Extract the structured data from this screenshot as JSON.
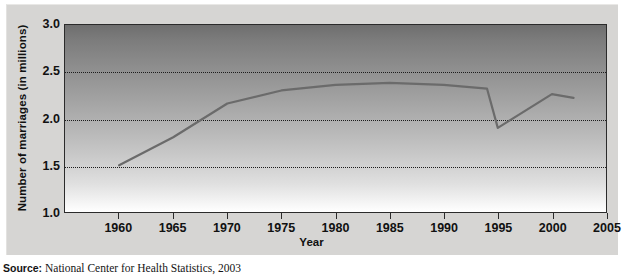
{
  "chart_data": {
    "type": "line",
    "title": "",
    "xlabel": "Year",
    "ylabel": "Number of marriages (in millions)",
    "xlim": [
      1955,
      2005
    ],
    "ylim": [
      1.0,
      3.0
    ],
    "xticks": [
      1960,
      1965,
      1970,
      1975,
      1980,
      1985,
      1990,
      1995,
      2000,
      2005
    ],
    "yticks": [
      1.0,
      1.5,
      2.0,
      2.5,
      3.0
    ],
    "xtick_labels": [
      "1960",
      "1965",
      "1970",
      "1975",
      "1980",
      "1985",
      "1990",
      "1995",
      "2000",
      "2005"
    ],
    "ytick_labels": [
      "1.0",
      "1.5",
      "2.0",
      "2.5",
      "3.0"
    ],
    "gridlines_y": [
      1.5,
      2.0,
      2.5
    ],
    "grid": true,
    "legend": false,
    "series": [
      {
        "name": "Number of marriages",
        "color": "#6b6b6b",
        "x": [
          1960,
          1965,
          1970,
          1975,
          1980,
          1985,
          1990,
          1994,
          1995,
          2000,
          2002
        ],
        "values": [
          1.5,
          1.8,
          2.16,
          2.3,
          2.36,
          2.38,
          2.36,
          2.32,
          1.9,
          2.26,
          2.22
        ]
      }
    ]
  },
  "axes": {
    "y_title": "Number of marriages (in millions)",
    "x_title": "Year"
  },
  "source": {
    "lead": "Source:",
    "text": " National Center for Health Statistics, 2003"
  },
  "colors": {
    "line": "#6b6b6b",
    "grid": "#1c1c1c",
    "frame": "#2b2b2b",
    "panel": "#d6d5d3",
    "text": "#111111"
  }
}
